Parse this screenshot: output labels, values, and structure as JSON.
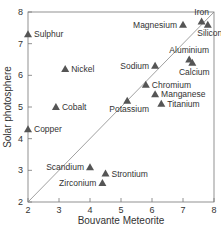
{
  "chart_data": {
    "type": "scatter",
    "title": "",
    "xlabel": "Bouvante Meteorite",
    "ylabel": "Solar photosphere",
    "xlim": [
      2,
      8
    ],
    "ylim": [
      2,
      8
    ],
    "xticks": [
      2,
      3,
      4,
      5,
      6,
      7,
      8
    ],
    "yticks": [
      2,
      3,
      4,
      5,
      6,
      7,
      8
    ],
    "grid": false,
    "reference_line": {
      "type": "y=x",
      "from": [
        2,
        2
      ],
      "to": [
        8,
        8
      ]
    },
    "marker": "triangle",
    "marker_color": "#555555",
    "points": [
      {
        "label": "Sulphur",
        "x": 2.0,
        "y": 7.3,
        "label_pos": "right"
      },
      {
        "label": "Nickel",
        "x": 3.2,
        "y": 6.2,
        "label_pos": "right"
      },
      {
        "label": "Cobalt",
        "x": 2.9,
        "y": 5.0,
        "label_pos": "right"
      },
      {
        "label": "Copper",
        "x": 2.0,
        "y": 4.3,
        "label_pos": "right"
      },
      {
        "label": "Scandium",
        "x": 4.0,
        "y": 3.1,
        "label_pos": "left"
      },
      {
        "label": "Strontium",
        "x": 4.5,
        "y": 2.9,
        "label_pos": "right"
      },
      {
        "label": "Zirconium",
        "x": 4.4,
        "y": 2.6,
        "label_pos": "left"
      },
      {
        "label": "Potassium",
        "x": 5.2,
        "y": 5.2,
        "label_pos": "below-left"
      },
      {
        "label": "Sodium",
        "x": 6.1,
        "y": 6.3,
        "label_pos": "left"
      },
      {
        "label": "Chromium",
        "x": 5.8,
        "y": 5.7,
        "label_pos": "right"
      },
      {
        "label": "Manganese",
        "x": 6.1,
        "y": 5.4,
        "label_pos": "right"
      },
      {
        "label": "Titanium",
        "x": 6.3,
        "y": 5.1,
        "label_pos": "right"
      },
      {
        "label": "Aluminium",
        "x": 7.2,
        "y": 6.5,
        "label_pos": "above"
      },
      {
        "label": "Calcium",
        "x": 7.3,
        "y": 6.4,
        "label_pos": "below"
      },
      {
        "label": "Magnesium",
        "x": 7.0,
        "y": 7.6,
        "label_pos": "left"
      },
      {
        "label": "Iron",
        "x": 7.6,
        "y": 7.7,
        "label_pos": "above"
      },
      {
        "label": "Silicon",
        "x": 7.8,
        "y": 7.6,
        "label_pos": "below-left"
      }
    ]
  }
}
